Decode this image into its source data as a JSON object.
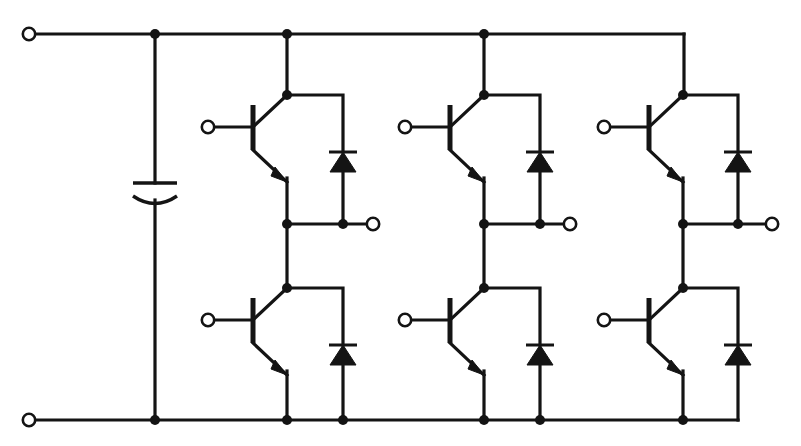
{
  "diagram": {
    "type": "schematic",
    "width": 801,
    "height": 446,
    "background_color": "#ffffff",
    "line_color": "#141414"
  },
  "rails": {
    "dc_positive": {
      "label": "dc-positive-rail",
      "y": 34,
      "x_start": 29,
      "x_end": 684,
      "terminal_x": 29
    },
    "dc_negative": {
      "label": "dc-negative-rail",
      "y": 420,
      "x_start": 29,
      "x_end": 738,
      "terminal_x": 29
    }
  },
  "dc_link_capacitor": {
    "name": "dc-link-capacitor",
    "type": "polarized-capacitor",
    "x": 155,
    "plate_top_y": 183,
    "plate_bottom_y": 200,
    "plate_half_width": 22
  },
  "phase_legs": [
    {
      "name": "phase-leg-u",
      "phase_label": "U",
      "switch_column_x": 287,
      "diode_column_x": 343,
      "gate_terminal_x": 208,
      "output_terminal_x": 373,
      "output_node_y": 224,
      "upper_switch": {
        "name": "igbt-upper-u",
        "type": "bjt-npn",
        "gate_terminal_y": 127,
        "collector_node_y": 95,
        "emitter_node_y": 224
      },
      "lower_switch": {
        "name": "igbt-lower-u",
        "type": "bjt-npn",
        "gate_terminal_y": 320,
        "collector_node_y": 288,
        "emitter_node_y": 420
      },
      "upper_diode": {
        "name": "freewheel-diode-upper-u",
        "type": "diode",
        "orientation": "cathode-up",
        "cathode_y": 152,
        "anode_y": 172
      },
      "lower_diode": {
        "name": "freewheel-diode-lower-u",
        "type": "diode",
        "orientation": "cathode-up",
        "cathode_y": 345,
        "anode_y": 365
      }
    },
    {
      "name": "phase-leg-v",
      "phase_label": "V",
      "switch_column_x": 484,
      "diode_column_x": 540,
      "gate_terminal_x": 405,
      "output_terminal_x": 570,
      "output_node_y": 224,
      "upper_switch": {
        "name": "igbt-upper-v",
        "type": "bjt-npn",
        "gate_terminal_y": 127,
        "collector_node_y": 95,
        "emitter_node_y": 224
      },
      "lower_switch": {
        "name": "igbt-lower-v",
        "type": "bjt-npn",
        "gate_terminal_y": 320,
        "collector_node_y": 288,
        "emitter_node_y": 420
      },
      "upper_diode": {
        "name": "freewheel-diode-upper-v",
        "type": "diode",
        "orientation": "cathode-up",
        "cathode_y": 152,
        "anode_y": 172
      },
      "lower_diode": {
        "name": "freewheel-diode-lower-v",
        "type": "diode",
        "orientation": "cathode-up",
        "cathode_y": 345,
        "anode_y": 365
      }
    },
    {
      "name": "phase-leg-w",
      "phase_label": "W",
      "switch_column_x": 683,
      "diode_column_x": 738,
      "gate_terminal_x": 604,
      "output_terminal_x": 772,
      "output_node_y": 224,
      "upper_switch": {
        "name": "igbt-upper-w",
        "type": "bjt-npn",
        "gate_terminal_y": 127,
        "collector_node_y": 95,
        "emitter_node_y": 224
      },
      "lower_switch": {
        "name": "igbt-lower-w",
        "type": "bjt-npn",
        "gate_terminal_y": 320,
        "collector_node_y": 288,
        "emitter_node_y": 420
      },
      "upper_diode": {
        "name": "freewheel-diode-upper-w",
        "type": "diode",
        "orientation": "cathode-up",
        "cathode_y": 152,
        "anode_y": 172
      },
      "lower_diode": {
        "name": "freewheel-diode-lower-w",
        "type": "diode",
        "orientation": "cathode-up",
        "cathode_y": 345,
        "anode_y": 365
      }
    }
  ],
  "junction_nodes": {
    "top_rail": [
      155,
      287,
      484
    ],
    "bottom_rail": [
      155,
      287,
      343,
      484,
      540,
      683
    ],
    "output_upper": [
      287,
      343,
      484,
      540,
      683,
      738
    ],
    "switch_collectors": [
      287,
      484,
      683
    ]
  },
  "terminals": {
    "count": 8,
    "dc_input_labels": [
      "dc-plus-terminal",
      "dc-minus-terminal"
    ],
    "ac_output_labels": [
      "ac-output-terminal-u",
      "ac-output-terminal-v",
      "ac-output-terminal-w"
    ],
    "gate_labels": [
      "gate-terminal-upper-u",
      "gate-terminal-lower-u",
      "gate-terminal-upper-v",
      "gate-terminal-lower-v",
      "gate-terminal-upper-w",
      "gate-terminal-lower-w"
    ],
    "ring_radius": 6.2
  },
  "geometry": {
    "transistor": {
      "gate_bar_x_offset": -34,
      "gate_bar_top_offset": -22,
      "gate_bar_bottom_offset": 22,
      "collector_slope_dx": 34,
      "collector_slope_dy": -32,
      "emitter_slope_dx": 34,
      "emitter_slope_dy": 32,
      "arrow_length": 16,
      "arrow_width": 9
    },
    "diode": {
      "bar_half_width": 14,
      "triangle_half_width": 13,
      "triangle_height": 20
    }
  }
}
